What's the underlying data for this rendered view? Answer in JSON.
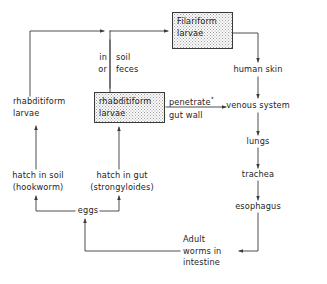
{
  "diagram": {
    "colors": {
      "line": "#3a3a3a",
      "text": "#1d1d1d",
      "box_fill_dots": "#9a9a9a",
      "background": "#ffffff"
    },
    "nodes": {
      "filariform_larvae": {
        "label": "Filariform\nlarvae",
        "boxed": true
      },
      "rhabditiform_larvae_boxed": {
        "label": "rhabditiform\nlarvae",
        "boxed": true
      },
      "rhabditiform_larvae_plain": {
        "label": "rhabditiform\nlarvae",
        "boxed": false
      },
      "human_skin": {
        "label": "human skin"
      },
      "venous_system": {
        "label": "venous system"
      },
      "lungs": {
        "label": "lungs"
      },
      "trachea": {
        "label": "trachea"
      },
      "esophagus": {
        "label": "esophagus"
      },
      "adult_worms": {
        "label": "Adult\nworms in\nintestine"
      },
      "hatch_in_soil": {
        "label": "hatch in soil\n(hookworm)"
      },
      "hatch_in_gut": {
        "label": "hatch in gut\n(strongyloides)"
      },
      "eggs": {
        "label": "eggs"
      }
    },
    "edge_labels": {
      "in_or": "in\nor",
      "soil_feces": "soil\nfeces",
      "penetrate": "penetrate",
      "penetrate_marker": "*",
      "gut_wall": "gut wall"
    }
  }
}
